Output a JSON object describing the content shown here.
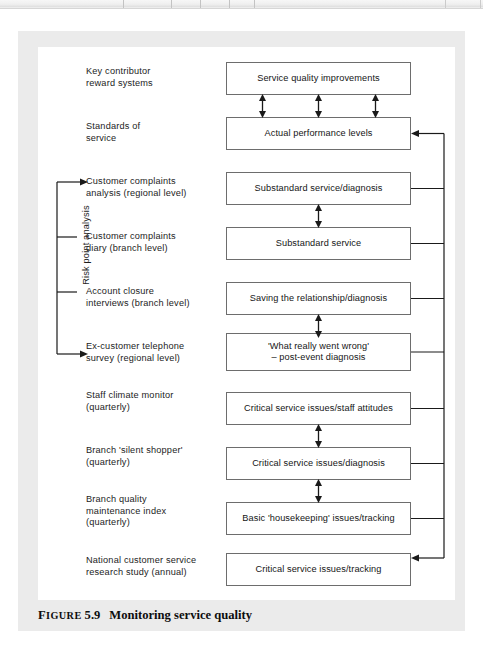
{
  "toolbar": {
    "present": true
  },
  "figure": {
    "caption_prefix": "Figure",
    "caption_number": "5.9",
    "caption_title": "Monitoring service quality"
  },
  "bracket": {
    "label": "Risk point analysis",
    "spans_rows": [
      3,
      4,
      5,
      6
    ]
  },
  "colors": {
    "box_border": "#6d6d6d",
    "line": "#1a1a1a",
    "paper": "#ebebeb",
    "plate": "#ffffff",
    "text": "#151515"
  },
  "rows": [
    {
      "id": "row-1",
      "label": "Key contributor\nreward systems",
      "label_lines": [
        "Key contributor",
        "reward systems"
      ],
      "box": "Service quality improvements",
      "box_lines": [
        "Service quality improvements"
      ],
      "in_bracket": false,
      "bus_connector": "none",
      "arrow_below": "triple-double"
    },
    {
      "id": "row-2",
      "label": "Standards of\nservice",
      "label_lines": [
        "Standards of",
        "service"
      ],
      "box": "Actual performance levels",
      "box_lines": [
        "Actual performance levels"
      ],
      "in_bracket": false,
      "bus_connector": "arrow-in",
      "arrow_below": "none"
    },
    {
      "id": "row-3",
      "label": "Customer complaints\nanalysis (regional level)",
      "label_lines": [
        "Customer complaints",
        "analysis (regional level)"
      ],
      "box": "Substandard service/diagnosis",
      "box_lines": [
        "Substandard service/diagnosis"
      ],
      "in_bracket": true,
      "bracket_tick": "arrow",
      "bus_connector": "tick",
      "arrow_below": "single-double"
    },
    {
      "id": "row-4",
      "label": "Customer complaints\ndiary (branch level)",
      "label_lines": [
        "Customer complaints",
        "diary (branch level)"
      ],
      "box": "Substandard service",
      "box_lines": [
        "Substandard service"
      ],
      "in_bracket": true,
      "bracket_tick": "plain",
      "bus_connector": "tick",
      "arrow_below": "none"
    },
    {
      "id": "row-5",
      "label": "Account closure\ninterviews (branch level)",
      "label_lines": [
        "Account closure",
        "interviews (branch level)"
      ],
      "box": "Saving the relationship/diagnosis",
      "box_lines": [
        "Saving the relationship/diagnosis"
      ],
      "in_bracket": true,
      "bracket_tick": "plain",
      "bus_connector": "tick",
      "arrow_below": "single-double"
    },
    {
      "id": "row-6",
      "label": "Ex-customer telephone\nsurvey (regional level)",
      "label_lines": [
        "Ex-customer telephone",
        "survey (regional level)"
      ],
      "box": "'What really went wrong' – post-event diagnosis",
      "box_lines": [
        "'What really went wrong'",
        "– post-event diagnosis"
      ],
      "in_bracket": true,
      "bracket_tick": "arrow",
      "bus_connector": "tick",
      "arrow_below": "none"
    },
    {
      "id": "row-7",
      "label": "Staff climate monitor\n(quarterly)",
      "label_lines": [
        "Staff climate monitor",
        "(quarterly)"
      ],
      "box": "Critical service issues/staff attitudes",
      "box_lines": [
        "Critical service issues/staff attitudes"
      ],
      "in_bracket": false,
      "bus_connector": "tick",
      "arrow_below": "single-double"
    },
    {
      "id": "row-8",
      "label": "Branch 'silent shopper'\n(quarterly)",
      "label_lines": [
        "Branch 'silent shopper'",
        "(quarterly)"
      ],
      "box": "Critical service issues/diagnosis",
      "box_lines": [
        "Critical service issues/diagnosis"
      ],
      "in_bracket": false,
      "bus_connector": "tick",
      "arrow_below": "single-double"
    },
    {
      "id": "row-9",
      "label": "Branch quality\nmaintenance index\n(quarterly)",
      "label_lines": [
        "Branch quality",
        "maintenance index",
        "(quarterly)"
      ],
      "box": "Basic 'housekeeping' issues/tracking",
      "box_lines": [
        "Basic 'housekeeping' issues/tracking"
      ],
      "in_bracket": false,
      "bus_connector": "tick",
      "arrow_below": "none"
    },
    {
      "id": "row-10",
      "label": "National customer service\nresearch study (annual)",
      "label_lines": [
        "National customer service",
        "research study (annual)"
      ],
      "box": "Critical service issues/tracking",
      "box_lines": [
        "Critical service issues/tracking"
      ],
      "in_bracket": false,
      "bus_connector": "arrow-in",
      "arrow_below": "none"
    }
  ]
}
